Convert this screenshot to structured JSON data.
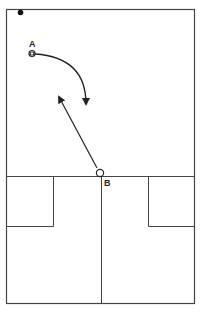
{
  "diagram": {
    "type": "court-play-diagram",
    "players": [
      {
        "id": "A",
        "label": "A",
        "marker": "circle-with-square",
        "x": 32,
        "y": 53
      },
      {
        "id": "B",
        "label": "B",
        "marker": "open-circle",
        "x": 100,
        "y": 173
      }
    ],
    "ball": {
      "marker": "filled-dot",
      "x": 20,
      "y": 12
    },
    "movements": [
      {
        "from": "A",
        "type": "curved-arrow",
        "description": "A cuts right and down"
      },
      {
        "from": "B",
        "type": "straight-arrow",
        "description": "B moves up-left"
      }
    ],
    "colors": {
      "line": "#333333",
      "background": "#ffffff"
    }
  }
}
